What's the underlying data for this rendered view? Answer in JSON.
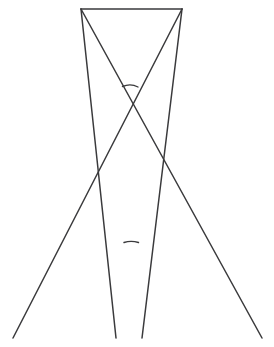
{
  "figure": {
    "background_color": "#ffffff",
    "line_color": "#3a3a3c",
    "line_width": 1.5,
    "canvas": {
      "width": 274,
      "height": 347
    },
    "points": {
      "left_apex": {
        "x": 81,
        "y": 9,
        "label": "A"
      },
      "right_apex": {
        "x": 182,
        "y": 9,
        "label": "B"
      },
      "left_steep_foot": {
        "x": 116,
        "y": 338,
        "label": "C"
      },
      "right_steep_foot": {
        "x": 142,
        "y": 338,
        "label": "D"
      },
      "left_shallow_foot": {
        "x": 13,
        "y": 338,
        "label": "E"
      },
      "right_shallow_foot": {
        "x": 262,
        "y": 338,
        "label": "F"
      }
    },
    "segments": [
      {
        "name": "top-bar",
        "x1": 81,
        "y1": 9,
        "x2": 182,
        "y2": 9
      },
      {
        "name": "left-apex-to-left-steep-foot",
        "x1": 81,
        "y1": 9,
        "x2": 116,
        "y2": 338
      },
      {
        "name": "left-apex-to-right-shallow-foot",
        "x1": 81,
        "y1": 9,
        "x2": 262,
        "y2": 338
      },
      {
        "name": "right-apex-to-right-steep-foot",
        "x1": 182,
        "y1": 9,
        "x2": 142,
        "y2": 338
      },
      {
        "name": "right-apex-to-left-shallow-foot",
        "x1": 182,
        "y1": 9,
        "x2": 13,
        "y2": 338
      }
    ],
    "arcs": [
      {
        "name": "upper-angle-arc",
        "center_x": 130,
        "center_y": 97,
        "radius": 13,
        "path": "M 122.5 86.5 Q 130.5 83.0 138.0 87.0"
      },
      {
        "name": "lower-angle-arc",
        "center_x": 131,
        "center_y": 263,
        "radius": 21,
        "path": "M 124.0 242.5 Q 131.0 240.2 138.5 242.5"
      }
    ],
    "intersections": [
      {
        "name": "upper-crossing",
        "x": 130,
        "y": 97
      },
      {
        "name": "left-crossing",
        "x": 105,
        "y": 148
      },
      {
        "name": "right-crossing",
        "x": 158,
        "y": 148
      },
      {
        "name": "lower-crossing",
        "x": 131,
        "y": 263
      }
    ]
  }
}
